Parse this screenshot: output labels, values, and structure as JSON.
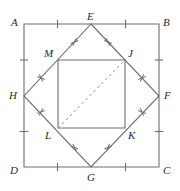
{
  "figure": {
    "width": 180,
    "height": 191,
    "background": "#ffffff",
    "stroke_color": "#6e6e6e",
    "dash_color": "#9a9a9a",
    "label_color": "#2b2b2b"
  },
  "shapes": {
    "outer_square": {
      "name": "ABCD",
      "points": "24,24 159,24 159,167 24,167",
      "vertices": [
        {
          "id": "A",
          "x": 24,
          "y": 24
        },
        {
          "id": "B",
          "x": 159,
          "y": 24
        },
        {
          "id": "C",
          "x": 159,
          "y": 167
        },
        {
          "id": "D",
          "x": 24,
          "y": 167
        }
      ]
    },
    "rotated_square": {
      "name": "EFGH",
      "points": "91,24 159,96 91,167 24,96",
      "vertices": [
        {
          "id": "E",
          "x": 91,
          "y": 24
        },
        {
          "id": "F",
          "x": 159,
          "y": 96
        },
        {
          "id": "G",
          "x": 91,
          "y": 167
        },
        {
          "id": "H",
          "x": 24,
          "y": 96
        }
      ]
    },
    "inner_square": {
      "name": "MJKL",
      "points": "58,60 125,60 125,128 58,128",
      "vertices": [
        {
          "id": "M",
          "x": 58,
          "y": 60
        },
        {
          "id": "J",
          "x": 125,
          "y": 60
        },
        {
          "id": "K",
          "x": 125,
          "y": 128
        },
        {
          "id": "L",
          "x": 58,
          "y": 128
        }
      ]
    },
    "diagonal": {
      "name": "LJ",
      "x1": 58,
      "y1": 128,
      "x2": 125,
      "y2": 60,
      "style": "dashed"
    }
  },
  "labels": [
    {
      "id": "A",
      "text": "A",
      "left": 11,
      "top": 17
    },
    {
      "id": "B",
      "text": "B",
      "left": 163,
      "top": 17
    },
    {
      "id": "C",
      "text": "C",
      "left": 163,
      "top": 165
    },
    {
      "id": "D",
      "text": "D",
      "left": 10,
      "top": 165
    },
    {
      "id": "E",
      "text": "E",
      "left": 87,
      "top": 11
    },
    {
      "id": "F",
      "text": "F",
      "left": 164,
      "top": 90
    },
    {
      "id": "G",
      "text": "G",
      "left": 87,
      "top": 172
    },
    {
      "id": "H",
      "text": "H",
      "left": 9,
      "top": 90
    },
    {
      "id": "M",
      "text": "M",
      "left": 44,
      "top": 48
    },
    {
      "id": "J",
      "text": "J",
      "left": 128,
      "top": 48
    },
    {
      "id": "K",
      "text": "K",
      "left": 128,
      "top": 130
    },
    {
      "id": "L",
      "text": "L",
      "left": 45,
      "top": 130
    }
  ],
  "tick_marks": {
    "outer_single": [
      {
        "edge": "AE",
        "cx": 57.5,
        "cy": 24,
        "orient": "vertical"
      },
      {
        "edge": "EB",
        "cx": 125.5,
        "cy": 24,
        "orient": "vertical"
      },
      {
        "edge": "BF",
        "cx": 159,
        "cy": 60,
        "orient": "horizontal"
      },
      {
        "edge": "FC",
        "cx": 159,
        "cy": 131.5,
        "orient": "horizontal"
      },
      {
        "edge": "CG",
        "cx": 125.5,
        "cy": 167,
        "orient": "vertical"
      },
      {
        "edge": "GD",
        "cx": 57.5,
        "cy": 167,
        "orient": "vertical"
      },
      {
        "edge": "DH",
        "cx": 24,
        "cy": 131.5,
        "orient": "horizontal"
      },
      {
        "edge": "HA",
        "cx": 24,
        "cy": 60,
        "orient": "horizontal"
      }
    ],
    "rotated_double": [
      {
        "edge": "EM",
        "cx": 74.5,
        "cy": 42,
        "angle": 47
      },
      {
        "edge": "EJ",
        "cx": 108,
        "cy": 42,
        "angle": -47
      },
      {
        "edge": "JF",
        "cx": 142,
        "cy": 78,
        "angle": 47
      },
      {
        "edge": "FK",
        "cx": 142,
        "cy": 112,
        "angle": -47
      },
      {
        "edge": "KG",
        "cx": 108,
        "cy": 147.5,
        "angle": 47
      },
      {
        "edge": "GL",
        "cx": 74.5,
        "cy": 147.5,
        "angle": -47
      },
      {
        "edge": "LH",
        "cx": 41,
        "cy": 112,
        "angle": 47
      },
      {
        "edge": "HM",
        "cx": 41,
        "cy": 78,
        "angle": -47
      }
    ]
  }
}
